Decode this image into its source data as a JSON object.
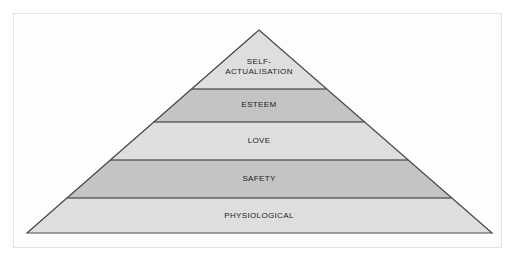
{
  "diagram": {
    "type": "pyramid",
    "orientation": "apex-up",
    "tier_count": 5,
    "frame": {
      "border_color": "#e2e2e2",
      "background_color": "#fdfdfd"
    },
    "outline_color": "#4a4a4a",
    "divider_color": "#2b2b2b",
    "label_color": "#1c1c1c",
    "tiers": [
      {
        "index": 1,
        "position_from_top": 1,
        "label": "SELF-\nACTUALISATION",
        "label_plain": "SELF-ACTUALISATION",
        "fill": "#dedede",
        "shade": "light"
      },
      {
        "index": 2,
        "position_from_top": 2,
        "label": "ESTEEM",
        "label_plain": "ESTEEM",
        "fill": "#c4c4c4",
        "shade": "dark"
      },
      {
        "index": 3,
        "position_from_top": 3,
        "label": "LOVE",
        "label_plain": "LOVE",
        "fill": "#dedede",
        "shade": "light"
      },
      {
        "index": 4,
        "position_from_top": 4,
        "label": "SAFETY",
        "label_plain": "SAFETY",
        "fill": "#c4c4c4",
        "shade": "dark"
      },
      {
        "index": 5,
        "position_from_top": 5,
        "label": "PHYSIOLOGICAL",
        "label_plain": "PHYSIOLOGICAL",
        "fill": "#dedede",
        "shade": "light"
      }
    ]
  }
}
